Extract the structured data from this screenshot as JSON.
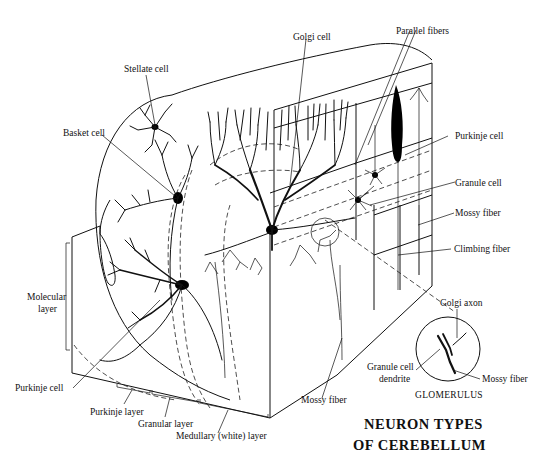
{
  "figure": {
    "title_line1": "NEURON TYPES",
    "title_line2": "OF CEREBELLUM",
    "inset_title": "GLOMERULUS"
  },
  "labels": {
    "stellate_cell": "Stellate cell",
    "basket_cell": "Basket cell",
    "golgi_cell": "Golgi cell",
    "parallel_fibers": "Parallel fibers",
    "purkinje_cell_right": "Purkinje cell",
    "granule_cell": "Granule cell",
    "mossy_fiber_right": "Mossy fiber",
    "climbing_fiber": "Climbing fiber",
    "molecular_layer_1": "Molecular",
    "molecular_layer_2": "layer",
    "purkinje_cell_left": "Purkinje cell",
    "purkinje_layer": "Purkinje layer",
    "granular_layer": "Granular layer",
    "medullary_layer": "Medullary (white) layer",
    "mossy_fiber_bottom": "Mossy fiber"
  },
  "glomerulus_labels": {
    "golgi_axon": "Golgi axon",
    "granule_dendrite_1": "Granule cell",
    "granule_dendrite_2": "dendrite",
    "mossy_fiber": "Mossy fiber"
  }
}
